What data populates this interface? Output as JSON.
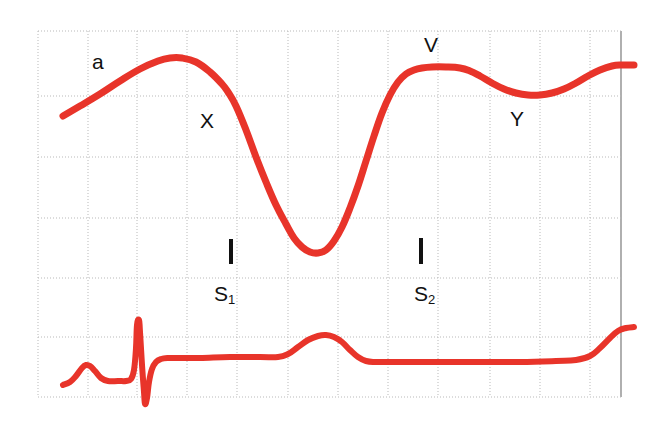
{
  "figure": {
    "background_color": "#ffffff",
    "trace_color": "#e8342a",
    "grid_color": "#b9b9b9",
    "grid_edge_color": "#8e8e8e",
    "label_color": "#111111"
  },
  "annotations": {
    "a_wave": "a",
    "x_descent": "X",
    "v_wave": "V",
    "y_descent": "Y",
    "s1_label": "S",
    "s1_sub": "1",
    "s2_label": "S",
    "s2_sub": "2"
  },
  "chart_data": {
    "type": "line",
    "xlabel": "",
    "ylabel": "",
    "grid": true,
    "legend": "none",
    "xlim": [
      0,
      661
    ],
    "ylim": [
      433,
      0
    ],
    "grid_lines": {
      "vertical_x": [
        38,
        88,
        137,
        187,
        237,
        288,
        338,
        388,
        438,
        490,
        540,
        590,
        621
      ],
      "horizontal_y": [
        31,
        96,
        157,
        218,
        278,
        337,
        397
      ],
      "right_edge_x": 621
    },
    "series": [
      {
        "name": "Jugular venous pulse",
        "color": "#e8342a",
        "linewidth": 7,
        "points": [
          [
            63,
            116
          ],
          [
            80,
            106
          ],
          [
            100,
            94
          ],
          [
            120,
            81
          ],
          [
            140,
            69
          ],
          [
            158,
            61
          ],
          [
            170,
            58
          ],
          [
            182,
            58
          ],
          [
            196,
            62
          ],
          [
            210,
            72
          ],
          [
            222,
            84
          ],
          [
            228,
            92
          ],
          [
            236,
            106
          ],
          [
            246,
            130
          ],
          [
            256,
            157
          ],
          [
            266,
            182
          ],
          [
            276,
            205
          ],
          [
            286,
            224
          ],
          [
            294,
            238
          ],
          [
            302,
            247
          ],
          [
            310,
            252
          ],
          [
            318,
            253
          ],
          [
            326,
            250
          ],
          [
            334,
            241
          ],
          [
            342,
            227
          ],
          [
            350,
            208
          ],
          [
            358,
            186
          ],
          [
            366,
            161
          ],
          [
            374,
            136
          ],
          [
            382,
            113
          ],
          [
            390,
            95
          ],
          [
            398,
            82
          ],
          [
            406,
            74
          ],
          [
            414,
            70
          ],
          [
            422,
            68
          ],
          [
            432,
            67
          ],
          [
            446,
            67
          ],
          [
            460,
            68
          ],
          [
            470,
            71
          ],
          [
            480,
            76
          ],
          [
            492,
            83
          ],
          [
            504,
            89
          ],
          [
            516,
            93
          ],
          [
            528,
            95
          ],
          [
            540,
            95
          ],
          [
            552,
            93
          ],
          [
            564,
            89
          ],
          [
            576,
            83
          ],
          [
            588,
            76
          ],
          [
            600,
            70
          ],
          [
            612,
            66
          ],
          [
            622,
            65
          ],
          [
            634,
            65
          ]
        ]
      },
      {
        "name": "Electrocardiogram",
        "color": "#e8342a",
        "linewidth": 6,
        "points": [
          [
            63,
            385
          ],
          [
            70,
            382
          ],
          [
            76,
            376
          ],
          [
            82,
            368
          ],
          [
            86,
            365
          ],
          [
            90,
            366
          ],
          [
            95,
            371
          ],
          [
            101,
            378
          ],
          [
            108,
            381
          ],
          [
            118,
            381
          ],
          [
            126,
            381
          ],
          [
            131,
            379
          ],
          [
            134,
            370
          ],
          [
            136,
            348
          ],
          [
            137,
            325
          ],
          [
            139,
            320
          ],
          [
            140,
            332
          ],
          [
            142,
            365
          ],
          [
            144,
            392
          ],
          [
            145,
            404
          ],
          [
            147,
            398
          ],
          [
            149,
            382
          ],
          [
            152,
            369
          ],
          [
            156,
            362
          ],
          [
            161,
            359
          ],
          [
            168,
            358
          ],
          [
            180,
            358
          ],
          [
            200,
            358
          ],
          [
            230,
            357
          ],
          [
            260,
            357
          ],
          [
            278,
            357
          ],
          [
            288,
            354
          ],
          [
            298,
            347
          ],
          [
            308,
            340
          ],
          [
            318,
            336
          ],
          [
            326,
            335
          ],
          [
            334,
            337
          ],
          [
            342,
            342
          ],
          [
            350,
            350
          ],
          [
            358,
            357
          ],
          [
            366,
            361
          ],
          [
            376,
            362
          ],
          [
            400,
            362
          ],
          [
            440,
            362
          ],
          [
            480,
            362
          ],
          [
            520,
            362
          ],
          [
            556,
            361
          ],
          [
            576,
            360
          ],
          [
            590,
            356
          ],
          [
            600,
            348
          ],
          [
            610,
            338
          ],
          [
            618,
            331
          ],
          [
            626,
            328
          ],
          [
            634,
            327
          ]
        ]
      }
    ]
  }
}
